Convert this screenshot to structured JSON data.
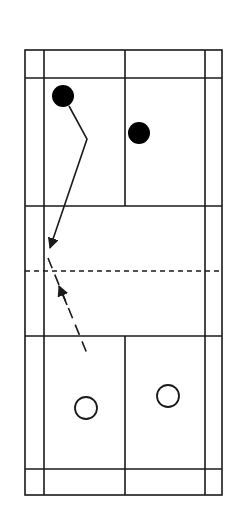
{
  "diagram": {
    "colors": {
      "line": "#1a1a1a",
      "background": "#ffffff",
      "filled_player": "#000000"
    },
    "court": {
      "left": 25,
      "right": 222,
      "top": 50,
      "bottom": 495,
      "inner_left": 44,
      "inner_right": 205,
      "center_x": 125,
      "top_back_service": 78,
      "top_short_service": 206,
      "net_y": 271,
      "bottom_short_service": 336,
      "bottom_back_service": 469
    },
    "players_filled": [
      {
        "cx": 63,
        "cy": 96,
        "r": 11
      },
      {
        "cx": 139,
        "cy": 133,
        "r": 11
      }
    ],
    "players_open": [
      {
        "cx": 86,
        "cy": 408,
        "r": 11
      },
      {
        "cx": 168,
        "cy": 396,
        "r": 11
      }
    ],
    "paths": {
      "solid": "M69,106 L87,139 L50,248",
      "dashed": "M48,258 L88,356"
    }
  }
}
